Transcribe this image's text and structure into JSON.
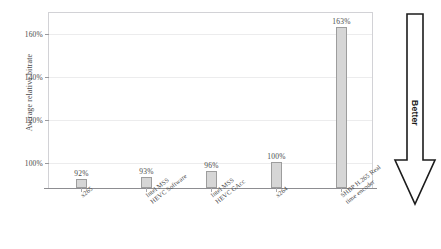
{
  "chart_data": {
    "type": "bar",
    "title": "",
    "xlabel": "",
    "ylabel": "Average relative bitrate",
    "ylim": [
      88,
      170
    ],
    "grid": true,
    "legend": false,
    "categories": [
      "x265",
      "Intel MSS HEVC Software",
      "Intel MSS HEVC GAcc",
      "x264",
      "SHBP H.265 Real time encoder"
    ],
    "category_lines": [
      [
        "x265"
      ],
      [
        "Intel MSS",
        "HEVC Software"
      ],
      [
        "Intel MSS",
        "HEVC GAcc"
      ],
      [
        "x264"
      ],
      [
        "SHBP H.265 Real",
        "time encoder"
      ]
    ],
    "values": [
      92,
      93,
      96,
      100,
      163
    ],
    "value_labels": [
      "92%",
      "93%",
      "96%",
      "100%",
      "163%"
    ],
    "y_ticks": [
      100,
      120,
      140,
      160
    ],
    "y_tick_labels": [
      "100%",
      "120%",
      "140%",
      "160%"
    ],
    "bar_fill": "#d6d6d6",
    "bar_stroke": "#9d9d9d",
    "grid_color": "#ececed",
    "axis_color": "#8d8d91"
  },
  "annotation": {
    "arrow_label": "Better",
    "arrow_direction": "down",
    "arrow_color": "#1c1c1c"
  },
  "figure": {
    "clipped_title": ""
  }
}
